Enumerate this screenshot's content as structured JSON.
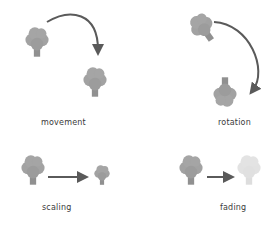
{
  "panels": {
    "movement": {
      "label": "movement"
    },
    "rotation": {
      "label": "rotation"
    },
    "scaling": {
      "label": "scaling"
    },
    "fading": {
      "label": "fading"
    }
  },
  "colors": {
    "tree": "#9a9a9a",
    "tree_faded": "#e2e2e2",
    "arrow": "#5a5a5a",
    "label": "#3a3a3a"
  },
  "icons": [
    "tree-icon",
    "arrow-icon"
  ]
}
